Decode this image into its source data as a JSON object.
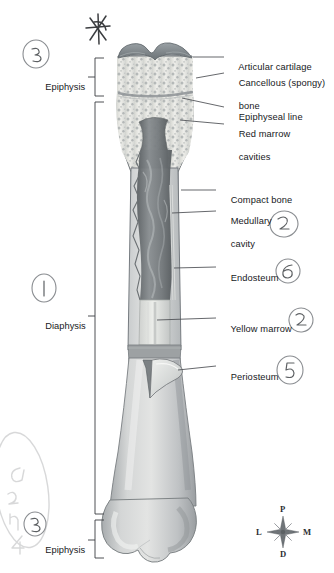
{
  "figure": {
    "background": "#ffffff"
  },
  "callouts": [
    {
      "id": "articular-cartilage",
      "text": "Articular cartilage",
      "x": 228,
      "y": 56,
      "line": [
        {
          "x": 203,
          "y": 62
        },
        {
          "x": 224,
          "y": 60
        }
      ]
    },
    {
      "id": "cancellous-bone",
      "text": "Cancellous (spongy)",
      "text2": "bone",
      "x": 228,
      "y": 74,
      "line": [
        {
          "x": 203,
          "y": 80
        },
        {
          "x": 224,
          "y": 78
        }
      ]
    },
    {
      "id": "epiphyseal-line",
      "text": "Epiphyseal line",
      "x": 228,
      "y": 105,
      "line": [
        {
          "x": 190,
          "y": 97
        },
        {
          "x": 224,
          "y": 109
        }
      ]
    },
    {
      "id": "red-marrow-cavities",
      "text": "Red marrow",
      "text2": "cavities",
      "x": 228,
      "y": 123,
      "line": [
        {
          "x": 196,
          "y": 117
        },
        {
          "x": 224,
          "y": 127
        }
      ]
    },
    {
      "id": "compact-bone",
      "text": "Compact bone",
      "x": 220,
      "y": 187,
      "line": [
        {
          "x": 182,
          "y": 191
        },
        {
          "x": 216,
          "y": 191
        }
      ]
    },
    {
      "id": "medullary-cavity",
      "text": "Medullary",
      "text2": "cavity",
      "x": 220,
      "y": 209,
      "line": [
        {
          "x": 178,
          "y": 213
        },
        {
          "x": 216,
          "y": 213
        }
      ]
    },
    {
      "id": "endosteum",
      "text": "Endosteum",
      "x": 220,
      "y": 265,
      "line": [
        {
          "x": 178,
          "y": 269
        },
        {
          "x": 216,
          "y": 269
        }
      ]
    },
    {
      "id": "yellow-marrow",
      "text": "Yellow marrow",
      "x": 220,
      "y": 315,
      "line": [
        {
          "x": 176,
          "y": 319
        },
        {
          "x": 216,
          "y": 319
        }
      ]
    },
    {
      "id": "periosteum",
      "text": "Periosteum",
      "x": 220,
      "y": 363,
      "line": [
        {
          "x": 178,
          "y": 367
        },
        {
          "x": 216,
          "y": 367
        }
      ]
    }
  ],
  "brackets": [
    {
      "id": "epiphysis-proximal",
      "label": "Epiphysis",
      "label_x": 38,
      "label_y": 74,
      "top": 60,
      "bottom": 97,
      "x": 96,
      "tick_y": 78
    },
    {
      "id": "diaphysis",
      "label": "Diaphysis",
      "label_x": 38,
      "label_y": 313,
      "top": 103,
      "bottom": 512,
      "x": 96,
      "tick_y": 317
    },
    {
      "id": "epiphysis-distal",
      "label": "Epiphysis",
      "label_x": 38,
      "label_y": 540,
      "top": 518,
      "bottom": 558,
      "x": 96,
      "tick_y": 544
    }
  ],
  "compass": {
    "center_x": 283,
    "center_y": 532,
    "north": "P",
    "south": "D",
    "west": "L",
    "east": "M"
  },
  "annotations": [
    {
      "id": "handwritten-star",
      "glyph": "✷",
      "x": 84,
      "y": 10,
      "size": 30,
      "rotate": -12
    },
    {
      "id": "handwritten-circled-3-top",
      "glyph": "3",
      "x": 26,
      "y": 44,
      "size": 13
    },
    {
      "id": "handwritten-circled-1",
      "glyph": "1",
      "x": 36,
      "y": 273,
      "size": 13
    },
    {
      "id": "handwritten-circled-2-medullary",
      "glyph": "2",
      "x": 271,
      "y": 212,
      "size": 13
    },
    {
      "id": "handwritten-circled-6-endosteum",
      "glyph": "6",
      "x": 277,
      "y": 263,
      "size": 13
    },
    {
      "id": "handwritten-circled-2-yellow-marrow",
      "glyph": "2",
      "x": 288,
      "y": 309,
      "size": 13
    },
    {
      "id": "handwritten-circled-5-periosteum",
      "glyph": "5",
      "x": 278,
      "y": 358,
      "size": 13
    },
    {
      "id": "handwritten-circled-3-bottom",
      "glyph": "3",
      "x": 26,
      "y": 514,
      "size": 13
    },
    {
      "id": "handwritten-quiz-4",
      "glyph": "Quiz 4",
      "x": 4,
      "y": 470,
      "size": 18,
      "rotate": -90
    }
  ],
  "colors": {
    "bone_light": "#dcdcdc",
    "bone_mid": "#b9bcbe",
    "bone_dark": "#8e9295",
    "cartilage": "#7e8589",
    "marrow_dark": "#6e7376",
    "spongy_fill": "#e6e6e3",
    "spongy_speck": "#9aa0a2",
    "leader": "#4a4d52",
    "text": "#17191c",
    "handwriting": "#8d8f93"
  }
}
